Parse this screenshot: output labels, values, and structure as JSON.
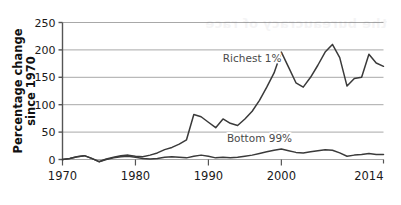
{
  "chart_data": {
    "type": "line",
    "title": "",
    "subtitle": "",
    "xlabel": "",
    "ylabel": "Percentage change since 1970",
    "ylabel_line1": "Percentage change",
    "ylabel_line2": "since 1970",
    "xlim": [
      1970,
      2014
    ],
    "ylim": [
      0,
      250
    ],
    "yticks": [
      0,
      50,
      100,
      150,
      200,
      250
    ],
    "ytick_labels": [
      "0",
      "50",
      "100",
      "150",
      "200",
      "250"
    ],
    "xticks": [
      1970,
      1980,
      1990,
      2000,
      2014
    ],
    "xtick_labels": [
      "1970",
      "1980",
      "1990",
      "2000",
      "2014"
    ],
    "grid": "horizontal",
    "legend": "inline-labels",
    "line_color": "#3a3a3a",
    "grid_color": "#a8a8a8",
    "axis_color": "#555555",
    "background": "#ffffff",
    "annotations": [
      {
        "text": "Richest 1%",
        "x": 1996.0,
        "y": 178
      },
      {
        "text": "Bottom 99%",
        "x": 1997.0,
        "y": 32
      }
    ],
    "x": [
      1970,
      1971,
      1972,
      1973,
      1974,
      1975,
      1976,
      1977,
      1978,
      1979,
      1980,
      1981,
      1982,
      1983,
      1984,
      1985,
      1986,
      1987,
      1988,
      1989,
      1990,
      1991,
      1992,
      1993,
      1994,
      1995,
      1996,
      1997,
      1998,
      1999,
      2000,
      2001,
      2002,
      2003,
      2004,
      2005,
      2006,
      2007,
      2008,
      2009,
      2010,
      2011,
      2012,
      2013,
      2014
    ],
    "series": [
      {
        "name": "Richest 1%",
        "color": "#3a3a3a",
        "values": [
          0,
          2,
          5,
          7,
          2,
          -4,
          1,
          4,
          7,
          8,
          6,
          5,
          8,
          12,
          18,
          22,
          28,
          36,
          82,
          78,
          68,
          58,
          74,
          66,
          62,
          74,
          88,
          108,
          132,
          158,
          196,
          168,
          140,
          132,
          150,
          172,
          196,
          210,
          186,
          134,
          148,
          150,
          192,
          176,
          170
        ]
      },
      {
        "name": "Bottom 99%",
        "color": "#3a3a3a",
        "values": [
          0,
          2,
          5,
          7,
          2,
          -4,
          0,
          3,
          5,
          6,
          4,
          2,
          1,
          2,
          4,
          5,
          4,
          3,
          6,
          8,
          6,
          3,
          4,
          3,
          4,
          6,
          8,
          11,
          14,
          17,
          19,
          16,
          13,
          12,
          14,
          16,
          18,
          17,
          12,
          6,
          8,
          9,
          11,
          9,
          9
        ]
      }
    ]
  },
  "ghost": {
    "bleed_text": "the bureaucracy of race"
  }
}
